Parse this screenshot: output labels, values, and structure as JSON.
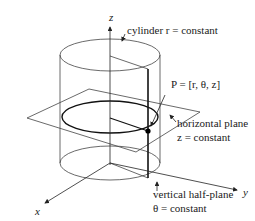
{
  "figure": {
    "type": "cylindrical coordinates diagram",
    "axes": {
      "x": "x",
      "y": "y",
      "z": "z"
    },
    "labels": {
      "cylinder": "cylinder r = constant",
      "point": "P = [r, θ, z]",
      "horizontal_plane_line1": "horizontal plane",
      "horizontal_plane_line2": "z = constant",
      "vertical_plane_line1": "vertical half-plane",
      "vertical_plane_line2": "θ = constant"
    },
    "colors": {
      "line": "#333333",
      "bold_line": "#111111",
      "point": "#000000"
    }
  }
}
